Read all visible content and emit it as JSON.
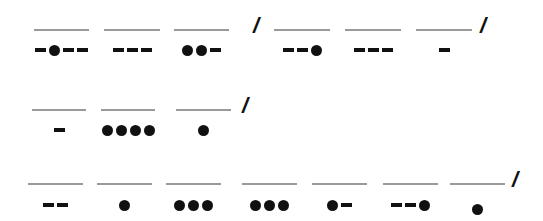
{
  "puzzle": {
    "type": "morse-code",
    "rows": [
      {
        "y_line": 29,
        "y_code": 50,
        "letters": [
          {
            "code": "-.--",
            "x": 34,
            "w": 55
          },
          {
            "code": "---",
            "x": 104,
            "w": 56
          },
          {
            "code": "..-",
            "x": 174,
            "w": 55
          },
          {
            "slash": "/",
            "x": 253
          },
          {
            "code": "--.",
            "x": 274,
            "w": 56
          },
          {
            "code": "---",
            "x": 345,
            "w": 56
          },
          {
            "code": "-",
            "x": 416,
            "w": 56
          },
          {
            "slash": "/",
            "x": 480
          }
        ]
      },
      {
        "y_line": 109,
        "y_code": 130,
        "letters": [
          {
            "code": "-",
            "x": 32,
            "w": 54
          },
          {
            "code": "....",
            "x": 101,
            "w": 54
          },
          {
            "code": ".",
            "x": 176,
            "w": 55
          },
          {
            "slash": "/",
            "x": 242
          }
        ]
      },
      {
        "y_line": 183,
        "y_code": 205,
        "letters": [
          {
            "code": "--",
            "x": 28,
            "w": 55
          },
          {
            "code": ".",
            "x": 97,
            "w": 55
          },
          {
            "code": "...",
            "x": 166,
            "w": 55
          },
          {
            "code": "...",
            "x": 242,
            "w": 55
          },
          {
            "code": ".-",
            "x": 312,
            "w": 55
          },
          {
            "code": "--.",
            "x": 383,
            "w": 55
          },
          {
            "code": ".",
            "x": 450,
            "w": 55,
            "dy": 4
          },
          {
            "slash": "/",
            "x": 512
          }
        ]
      }
    ]
  }
}
